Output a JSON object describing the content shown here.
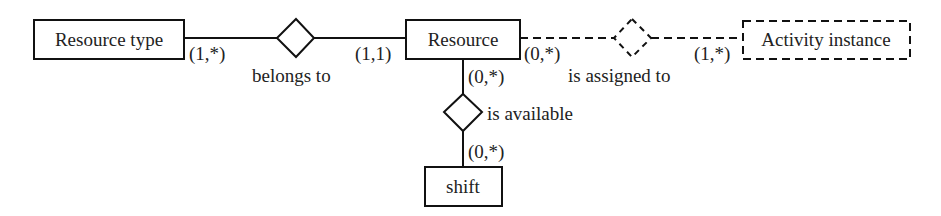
{
  "diagram": {
    "type": "entity-relationship",
    "entities": [
      {
        "id": "resource_type",
        "label": "Resource type",
        "style": "solid"
      },
      {
        "id": "resource",
        "label": "Resource",
        "style": "solid"
      },
      {
        "id": "activity_instance",
        "label": "Activity instance",
        "style": "dashed"
      },
      {
        "id": "shift",
        "label": "shift",
        "style": "solid"
      }
    ],
    "relationships": [
      {
        "id": "belongs_to",
        "label": "belongs to",
        "style": "solid",
        "from": "resource_type",
        "from_card": "(1,*)",
        "to": "resource",
        "to_card": "(1,1)"
      },
      {
        "id": "is_assigned_to",
        "label": "is assigned to",
        "style": "dashed",
        "from": "resource",
        "from_card": "(0,*)",
        "to": "activity_instance",
        "to_card": "(1,*)"
      },
      {
        "id": "is_available",
        "label": "is available",
        "style": "solid",
        "from": "resource",
        "from_card": "(0,*)",
        "to": "shift",
        "to_card": "(0,*)"
      }
    ]
  }
}
